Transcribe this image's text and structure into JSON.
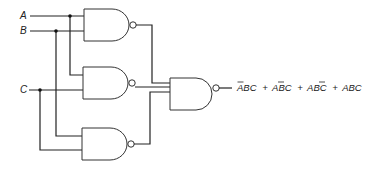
{
  "diagram": {
    "type": "logic-circuit",
    "inputs": [
      {
        "label": "A"
      },
      {
        "label": "B"
      },
      {
        "label": "C"
      }
    ],
    "gates": [
      {
        "id": "gate-1",
        "type": "NAND",
        "inputs": [
          "A",
          "B"
        ]
      },
      {
        "id": "gate-2",
        "type": "NAND",
        "inputs": [
          "A",
          "C"
        ]
      },
      {
        "id": "gate-3",
        "type": "NAND",
        "inputs": [
          "B",
          "C"
        ]
      },
      {
        "id": "gate-out",
        "type": "NAND",
        "inputs": [
          "gate-1",
          "gate-2",
          "gate-3"
        ]
      }
    ],
    "output_expression": {
      "terms": [
        {
          "text": "ABC",
          "bars": [
            0
          ]
        },
        {
          "text": "ABC",
          "bars": [
            1
          ]
        },
        {
          "text": "ABC",
          "bars": [
            2
          ]
        },
        {
          "text": "ABC",
          "bars": []
        }
      ],
      "separator": "+",
      "full_text": "ĀBC + AB̄C + ABC̄ + ABC"
    },
    "colors": {
      "line": "#222222",
      "background": "#ffffff"
    }
  }
}
